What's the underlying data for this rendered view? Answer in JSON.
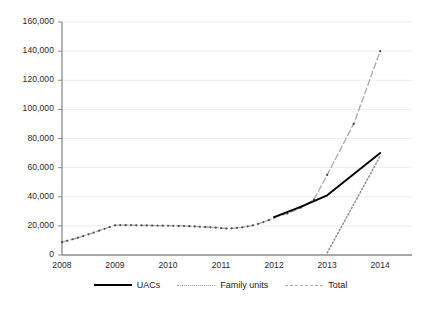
{
  "chart_data": {
    "type": "line",
    "title": "",
    "xlabel": "",
    "ylabel": "",
    "ylim": [
      0,
      160000
    ],
    "xlim": [
      2008,
      2014.6
    ],
    "grid": true,
    "legend_position": "bottom",
    "y_ticks": [
      0,
      20000,
      40000,
      60000,
      80000,
      100000,
      120000,
      140000,
      160000
    ],
    "y_tick_labels": [
      "0",
      "20,000",
      "40,000",
      "60,000",
      "80,000",
      "100,000",
      "120,000",
      "140,000",
      "160,000"
    ],
    "x_ticks": [
      2008,
      2009,
      2010,
      2011,
      2012,
      2013,
      2014
    ],
    "x_tick_labels": [
      "2008",
      "2009",
      "2010",
      "2011",
      "2012",
      "2013",
      "2014"
    ],
    "series": [
      {
        "name": "Total",
        "style": "dashed",
        "color": "#a9a9a9",
        "markers": true,
        "x": [
          2008.0,
          2008.1,
          2008.2,
          2008.3,
          2008.4,
          2008.5,
          2008.6,
          2008.7,
          2008.8,
          2008.9,
          2009.0,
          2009.1,
          2009.2,
          2009.3,
          2009.4,
          2009.5,
          2009.6,
          2009.7,
          2009.8,
          2009.9,
          2010.0,
          2010.1,
          2010.2,
          2010.3,
          2010.4,
          2010.5,
          2010.6,
          2010.7,
          2010.8,
          2010.9,
          2011.0,
          2011.1,
          2011.2,
          2011.3,
          2011.4,
          2011.5,
          2011.6,
          2011.7,
          2011.8,
          2011.9,
          2012.0,
          2012.25,
          2012.5,
          2012.75,
          2013.0,
          2013.5,
          2014.0
        ],
        "values": [
          8800,
          9800,
          10800,
          11900,
          13000,
          14200,
          15400,
          16700,
          18000,
          19200,
          20400,
          20500,
          20500,
          20450,
          20400,
          20350,
          20300,
          20250,
          20200,
          20150,
          20100,
          20050,
          20000,
          19900,
          19800,
          19600,
          19400,
          19200,
          19000,
          18800,
          18400,
          18200,
          18300,
          18600,
          19000,
          19600,
          20400,
          21400,
          22600,
          24000,
          25700,
          28500,
          32500,
          38000,
          55000,
          90000,
          140000
        ]
      },
      {
        "name": "UACs",
        "style": "solid",
        "color": "#000000",
        "markers": false,
        "x": [
          2012.0,
          2012.5,
          2013.0,
          2014.0
        ],
        "values": [
          26000,
          33000,
          41000,
          70000
        ]
      },
      {
        "name": "Family units",
        "style": "dotted",
        "color": "#8c8c8c",
        "markers": false,
        "x": [
          2013.0,
          2014.0
        ],
        "values": [
          1500,
          68000
        ]
      }
    ]
  },
  "legend": {
    "items": [
      {
        "label": "UACs",
        "style": "solid"
      },
      {
        "label": "Family units",
        "style": "dotted"
      },
      {
        "label": "Total",
        "style": "dashed"
      }
    ]
  },
  "colors": {
    "axis": "#8a8a8a",
    "grid": "#ededed",
    "text": "#1a1a1a",
    "uacs": "#000000",
    "family_units": "#8c8c8c",
    "total": "#a9a9a9",
    "background": "#ffffff"
  }
}
